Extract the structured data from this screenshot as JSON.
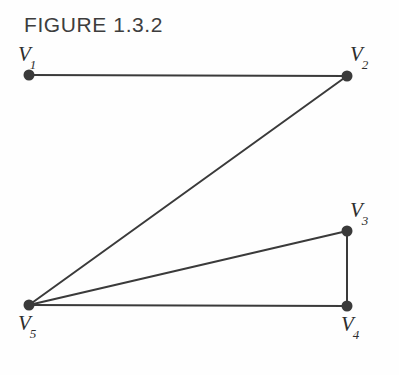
{
  "figure": {
    "title": "FIGURE 1.3.2",
    "background_color": "#fefefe",
    "stroke_color": "#3a3a3a",
    "label_color": "#2e2e2e",
    "title_color": "#3d3d3d"
  },
  "chart_data": {
    "type": "diagram",
    "diagram_kind": "undirected-graph",
    "title": "FIGURE 1.3.2",
    "nodes": [
      {
        "id": "V1",
        "label_base": "V",
        "label_sub": "1",
        "x": 29,
        "y": 75,
        "label_x": 18,
        "label_y": 44
      },
      {
        "id": "V2",
        "label_base": "V",
        "label_sub": "2",
        "x": 347,
        "y": 76,
        "label_x": 350,
        "label_y": 44
      },
      {
        "id": "V3",
        "label_base": "V",
        "label_sub": "3",
        "x": 347,
        "y": 231,
        "label_x": 350,
        "label_y": 200
      },
      {
        "id": "V4",
        "label_base": "V",
        "label_sub": "4",
        "x": 347,
        "y": 306,
        "label_x": 341,
        "label_y": 314
      },
      {
        "id": "V5",
        "label_base": "V",
        "label_sub": "5",
        "x": 29,
        "y": 305,
        "label_x": 18,
        "label_y": 313
      }
    ],
    "edges": [
      {
        "from": "V1",
        "to": "V2"
      },
      {
        "from": "V2",
        "to": "V5"
      },
      {
        "from": "V5",
        "to": "V3"
      },
      {
        "from": "V5",
        "to": "V4"
      },
      {
        "from": "V3",
        "to": "V4"
      }
    ],
    "node_radius": 5.5,
    "edge_width": 2,
    "xlim": [
      0,
      399
    ],
    "ylim": [
      0,
      375
    ]
  }
}
